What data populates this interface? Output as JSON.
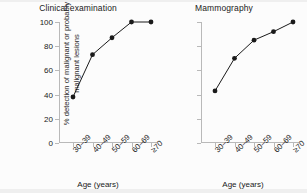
{
  "figure": {
    "ylabel": "% detection of malignant or probably malignant lesions",
    "xlabel": "Age (years)"
  },
  "chart_data": [
    {
      "type": "line",
      "title": "Clinical examination",
      "categories": [
        "30–39",
        "40–49",
        "50–59",
        "60–69",
        "≥70"
      ],
      "values": [
        38,
        73,
        87,
        100,
        100
      ],
      "xlabel": "Age (years)",
      "ylabel": "% detection of malignant or probably malignant lesions",
      "ylim": [
        0,
        100
      ],
      "yticks": [
        0,
        20,
        40,
        60,
        80,
        100
      ],
      "grid": false,
      "marker": "filled-circle",
      "color": "#1a1a1a"
    },
    {
      "type": "line",
      "title": "Mammography",
      "categories": [
        "30–39",
        "40–49",
        "50–59",
        "60–69",
        "≥70"
      ],
      "values": [
        43,
        70,
        85,
        92,
        100
      ],
      "xlabel": "Age (years)",
      "ylabel": "",
      "ylim": [
        0,
        100
      ],
      "yticks": [
        0,
        20,
        40,
        60,
        80,
        100
      ],
      "grid": false,
      "marker": "filled-circle",
      "color": "#1a1a1a"
    }
  ]
}
